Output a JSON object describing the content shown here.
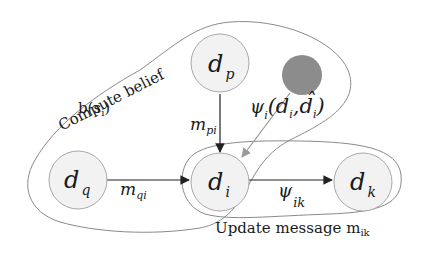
{
  "diagram": {
    "nodes": {
      "dp": {
        "main": "d",
        "sub": "p"
      },
      "dq": {
        "main": "d",
        "sub": "q"
      },
      "di": {
        "main": "d",
        "sub": "i"
      },
      "dk": {
        "main": "d",
        "sub": "k"
      },
      "observed": {
        "label": ""
      }
    },
    "edges": {
      "m_pi": {
        "main": "m",
        "sub": "pi"
      },
      "m_qi": {
        "main": "m",
        "sub": "qi"
      },
      "psi_ik": {
        "main": "ψ",
        "sub": "ik"
      },
      "psi_i": {
        "main": "ψ",
        "sub": "i",
        "args_open": "(",
        "arg1": "d",
        "arg1_sub": "i",
        "comma": ",",
        "arg2": "d̂",
        "arg2_sub": "i",
        "args_close": ")"
      }
    },
    "regions": {
      "compute_belief": {
        "line1": "Compute belief",
        "line2_main": "b(s",
        "line2_sub": "i",
        "line2_close": ")"
      },
      "update_message": {
        "main": "Update message m",
        "sub": "ik"
      }
    },
    "colors": {
      "node_fill": "#f2f2f2",
      "node_stroke": "#a8a8a8",
      "observed_fill": "#8c8c8c",
      "edge": "#222222",
      "evidence_edge": "#9a9a9a",
      "region_stroke": "#8a8a8a"
    }
  }
}
